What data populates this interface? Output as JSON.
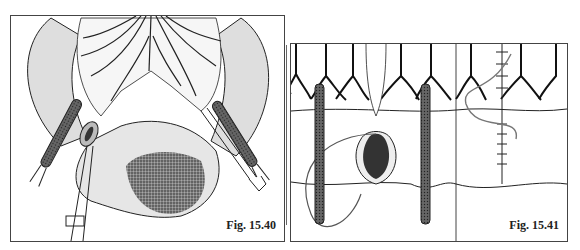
{
  "figures": [
    {
      "caption": "Fig. 15.40",
      "description": "Surgical illustration: bowel loop with mesenteric vessels, two occlusion clamps, tissue forceps and shaded lesion"
    },
    {
      "caption": "Fig. 15.41",
      "description": "Two-panel surgical illustration: bowel wall with vessels, clamps and suture placement; right panel shows completed suture line"
    }
  ],
  "colors": {
    "ink": "#222222",
    "tint": "#dcdcdc",
    "lesion": "#555555"
  }
}
